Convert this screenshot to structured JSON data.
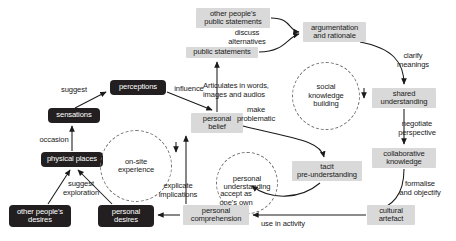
{
  "diagram": {
    "colors": {
      "dark_node_bg": "#231f20",
      "dark_node_text": "#ffffff",
      "light_node_bg": "#d9d9d9",
      "light_node_text": "#1a1a1a",
      "circle_stroke": "#6e6e6e",
      "arrow": "#1a1a1a",
      "background": "#ffffff"
    },
    "nodes": [
      {
        "id": "other_peoples_public_statements",
        "label": "other people's\npublic statements",
        "style": "light",
        "x": 196,
        "y": 8,
        "w": 74,
        "h": 20
      },
      {
        "id": "public_statements",
        "label": "public statements",
        "style": "light",
        "x": 186,
        "y": 47,
        "w": 72,
        "h": 11
      },
      {
        "id": "argumentation_and_rationale",
        "label": "argumentation\nand rationale",
        "style": "light",
        "x": 303,
        "y": 22,
        "w": 63,
        "h": 20
      },
      {
        "id": "social_knowledge_building",
        "label": "social\nknowledge\nbuilding",
        "style": "circle",
        "x": 292,
        "y": 62,
        "w": 68,
        "h": 68
      },
      {
        "id": "shared_understanding",
        "label": "shared\nunderstanding",
        "style": "light",
        "x": 372,
        "y": 88,
        "w": 64,
        "h": 20
      },
      {
        "id": "collaborative_knowledge",
        "label": "collaborative\nknowledge",
        "style": "light",
        "x": 372,
        "y": 148,
        "w": 64,
        "h": 20
      },
      {
        "id": "cultural_artefact",
        "label": "cultural\nartefact",
        "style": "light",
        "x": 367,
        "y": 205,
        "w": 48,
        "h": 20
      },
      {
        "id": "perceptions",
        "label": "perceptions",
        "style": "dark",
        "x": 110,
        "y": 80,
        "w": 56,
        "h": 15
      },
      {
        "id": "sensations",
        "label": "sensations",
        "style": "dark",
        "x": 48,
        "y": 108,
        "w": 52,
        "h": 15
      },
      {
        "id": "physical_places",
        "label": "physical places",
        "style": "dark",
        "x": 41,
        "y": 152,
        "w": 62,
        "h": 15
      },
      {
        "id": "other_peoples_desires",
        "label": "other people's\ndesires",
        "style": "dark",
        "x": 9,
        "y": 205,
        "w": 62,
        "h": 22
      },
      {
        "id": "personal_desires",
        "label": "personal\ndesires",
        "style": "dark",
        "x": 98,
        "y": 205,
        "w": 56,
        "h": 22
      },
      {
        "id": "personal_belief",
        "label": "personal\nbelief",
        "style": "light",
        "x": 191,
        "y": 113,
        "w": 52,
        "h": 20
      },
      {
        "id": "on_site_experience",
        "label": "on-site\nexperience",
        "style": "circle",
        "x": 100,
        "y": 130,
        "w": 72,
        "h": 72
      },
      {
        "id": "personal_understanding",
        "label": "personal\nunderstanding",
        "style": "circle",
        "x": 216,
        "y": 152,
        "w": 62,
        "h": 62
      },
      {
        "id": "tacit_pre_understanding",
        "label": "tacit\npre-understanding",
        "style": "light",
        "x": 292,
        "y": 161,
        "w": 70,
        "h": 20
      },
      {
        "id": "personal_comprehension",
        "label": "personal\ncomprehension",
        "style": "light",
        "x": 183,
        "y": 205,
        "w": 66,
        "h": 20
      }
    ],
    "edge_labels": [
      {
        "id": "discuss_alternatives",
        "text": "discuss\nalternatives",
        "x": 216,
        "y": 29,
        "w": 62,
        "align": "center"
      },
      {
        "id": "clarify_meanings",
        "text": "clarify\nmeanings",
        "x": 390,
        "y": 52,
        "w": 46,
        "align": "center"
      },
      {
        "id": "negotiate_perspective",
        "text": "negotiate\nperspective",
        "x": 390,
        "y": 120,
        "w": 54,
        "align": "center"
      },
      {
        "id": "formalise_and_objectify",
        "text": "formalise\nand objectify",
        "x": 389,
        "y": 180,
        "w": 62,
        "align": "center"
      },
      {
        "id": "articulates_in_words",
        "text": "Articulates in words,\nimages and  audios",
        "x": 203,
        "y": 82,
        "w": 86,
        "align": "left"
      },
      {
        "id": "make_problematic",
        "text": "make\nproblematic",
        "x": 228,
        "y": 106,
        "w": 56,
        "align": "center"
      },
      {
        "id": "influence",
        "text": "influence",
        "x": 170,
        "y": 85,
        "w": 38,
        "align": "center"
      },
      {
        "id": "suggest",
        "text": "suggest",
        "x": 58,
        "y": 86,
        "w": 32,
        "align": "center"
      },
      {
        "id": "occasion",
        "text": "occasion",
        "x": 36,
        "y": 136,
        "w": 36,
        "align": "center"
      },
      {
        "id": "suggest_exploration",
        "text": "suggest\nexploration",
        "x": 54,
        "y": 180,
        "w": 54,
        "align": "center"
      },
      {
        "id": "explicate_implications",
        "text": "explicate\nimplications",
        "x": 150,
        "y": 182,
        "w": 56,
        "align": "center"
      },
      {
        "id": "accept_as_ones_own",
        "text": "accept as\none's own",
        "x": 211,
        "y": 190,
        "w": 50,
        "align": "center"
      },
      {
        "id": "use_in_activity",
        "text": "use in activity",
        "x": 254,
        "y": 220,
        "w": 58,
        "align": "center"
      }
    ]
  }
}
